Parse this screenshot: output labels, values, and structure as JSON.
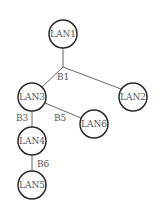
{
  "diagram": {
    "type": "tree",
    "nodes": [
      {
        "id": "LAN1",
        "label": "LAN1",
        "x": 63,
        "y": 34
      },
      {
        "id": "LAN2",
        "label": "LAN2",
        "x": 133,
        "y": 97
      },
      {
        "id": "LAN3",
        "label": "LAN3",
        "x": 32,
        "y": 97
      },
      {
        "id": "LAN4",
        "label": "LAN4",
        "x": 32,
        "y": 141
      },
      {
        "id": "LAN5",
        "label": "LAN5",
        "x": 32,
        "y": 185
      },
      {
        "id": "LAN6",
        "label": "LAN6",
        "x": 94,
        "y": 124
      }
    ],
    "bridges": [
      {
        "id": "B1",
        "label": "B1",
        "connects": [
          "LAN1",
          "LAN2",
          "LAN3"
        ]
      },
      {
        "id": "B3",
        "label": "B3",
        "connects": [
          "LAN3",
          "LAN4"
        ]
      },
      {
        "id": "B5",
        "label": "B5",
        "connects": [
          "LAN3",
          "LAN6"
        ]
      },
      {
        "id": "B6",
        "label": "B6",
        "connects": [
          "LAN4",
          "LAN5"
        ]
      }
    ]
  }
}
